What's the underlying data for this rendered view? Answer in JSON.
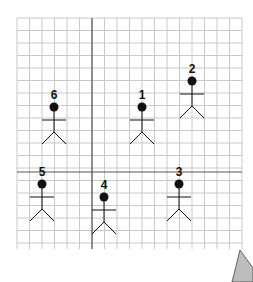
{
  "diagram": {
    "grid": {
      "left": 17,
      "top": 18,
      "right": 242,
      "bottom": 249,
      "spacing": 12.5,
      "line_color": "#c8c8c8",
      "axis_color": "#555555",
      "axis_x": 92,
      "axis_y": 172
    },
    "figures": [
      {
        "label": "1",
        "head_x": 142,
        "head_y": 107,
        "quadrant": "top-right"
      },
      {
        "label": "2",
        "head_x": 192,
        "head_y": 81,
        "quadrant": "top-right"
      },
      {
        "label": "3",
        "head_x": 179,
        "head_y": 184,
        "quadrant": "bottom-right"
      },
      {
        "label": "4",
        "head_x": 104,
        "head_y": 197,
        "quadrant": "bottom-right"
      },
      {
        "label": "5",
        "head_x": 42,
        "head_y": 184,
        "quadrant": "bottom-left"
      },
      {
        "label": "6",
        "head_x": 54,
        "head_y": 107,
        "quadrant": "top-left"
      }
    ],
    "figure_color": "#111111",
    "cursor_shape_color": "#bdbdbd"
  }
}
